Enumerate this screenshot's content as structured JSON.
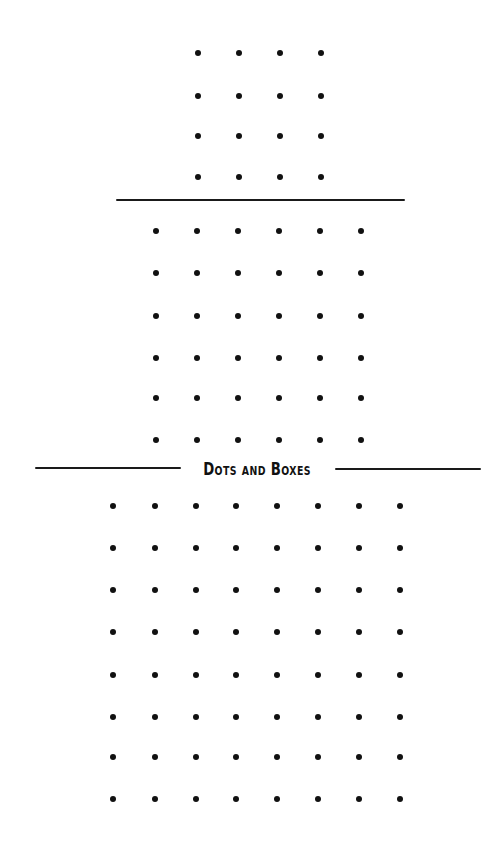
{
  "title": "Dots and Boxes",
  "colors": {
    "dot": "#111111",
    "rule": "#1a1a1a",
    "background": "#ffffff"
  },
  "boards": [
    {
      "name": "board-4x4",
      "rows": 4,
      "cols": 4,
      "xs": [
        198,
        239,
        280,
        321
      ],
      "ys": [
        53,
        96,
        136,
        177
      ]
    },
    {
      "name": "board-6x6",
      "rows": 6,
      "cols": 6,
      "xs": [
        156,
        197,
        238,
        279,
        320,
        361
      ],
      "ys": [
        231,
        273,
        316,
        358,
        398,
        440
      ]
    },
    {
      "name": "board-8x8",
      "rows": 8,
      "cols": 8,
      "xs": [
        113,
        155,
        196,
        236,
        277,
        318,
        359,
        400
      ],
      "ys": [
        506,
        548,
        590,
        632,
        675,
        717,
        757,
        799
      ]
    }
  ],
  "rules": [
    {
      "name": "divider-top",
      "x1": 116,
      "x2": 405,
      "y": 200
    },
    {
      "name": "title-rule-left",
      "x1": 35,
      "x2": 181,
      "y": 468
    },
    {
      "name": "title-rule-right",
      "x1": 335,
      "x2": 481,
      "y": 469
    }
  ]
}
